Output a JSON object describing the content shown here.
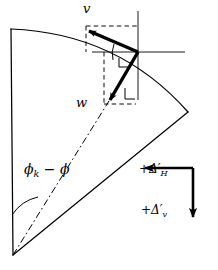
{
  "figure": {
    "type": "geometric-vector-diagram",
    "background_color": "#ffffff",
    "stroke_color": "#000000"
  },
  "labels": {
    "v_vector": "v",
    "w_vector": "w",
    "angle": "ϕₖ − ϕ",
    "angle_symbol_base": "ϕ",
    "angle_subscript": "k",
    "angle_operator": "−",
    "delta_h": "+Δ′",
    "delta_h_subscript": "H",
    "delta_v": "+Δ′",
    "delta_v_subscript": "v"
  },
  "geometry": {
    "sector_apex": [
      13,
      255
    ],
    "sector_left_edge_top": [
      11,
      29
    ],
    "arc_right_end": [
      188,
      112
    ],
    "center_point": [
      138,
      52
    ],
    "v_tip": [
      85,
      30
    ],
    "w_tip": [
      108,
      103
    ],
    "axis_horizontal_right": [
      185,
      52
    ],
    "axis_vertical_top": [
      138,
      11
    ],
    "axis_vertical_bottom": [
      138,
      100
    ],
    "legend_corner": [
      193,
      168
    ],
    "legend_arrow_left_tip": [
      140,
      168
    ],
    "legend_arrow_down_tip": [
      193,
      222
    ]
  },
  "line_styles": {
    "sector_outline": "solid",
    "vectors": "solid-bold",
    "projections": "dashed",
    "radius_to_point": "dash-dot",
    "axes": "solid-thin",
    "legend_arrows": "solid-bold"
  }
}
